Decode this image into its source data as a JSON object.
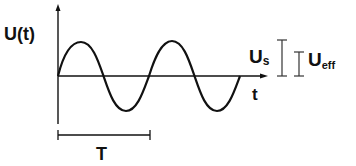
{
  "diagram": {
    "y_axis_label": "U(t)",
    "x_axis_label": "t",
    "period_label": "T",
    "peak_label": {
      "main": "U",
      "sub": "s"
    },
    "effective_label": {
      "main": "U",
      "sub": "eff"
    },
    "colors": {
      "line": "#111111",
      "background": "#ffffff"
    }
  }
}
